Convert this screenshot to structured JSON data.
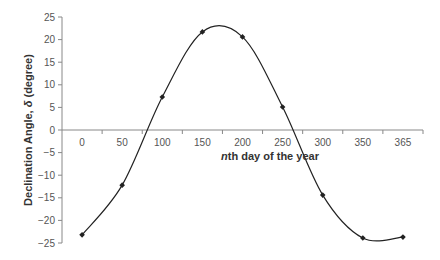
{
  "chart_data": {
    "type": "line",
    "title": "",
    "xlabel_italic_prefix": "n",
    "xlabel_rest": "th day of the year",
    "xlabel": "nth day of the year",
    "ylabel_prefix": "Declination Angle, ",
    "ylabel_symbol": "δ",
    "ylabel_suffix": " (degree)",
    "ylabel": "Declination Angle, δ (degree)",
    "categories": [
      "0",
      "50",
      "100",
      "150",
      "200",
      "250",
      "300",
      "350",
      "365"
    ],
    "x": [
      0,
      50,
      100,
      150,
      200,
      250,
      300,
      350,
      365
    ],
    "series": [
      {
        "name": "Declination Angle",
        "values": [
          -23.2,
          -12.2,
          7.3,
          21.7,
          20.6,
          5.1,
          -14.4,
          -23.9,
          -23.7
        ],
        "smooth": true,
        "marker": "diamond",
        "color": "#222222"
      }
    ],
    "ylim": [
      -25,
      25
    ],
    "yticks": [
      25,
      20,
      15,
      10,
      5,
      0,
      -5,
      -10,
      -15,
      -20,
      -25
    ],
    "ytick_labels": [
      "25",
      "20",
      "15",
      "10",
      "5",
      "0",
      "-5",
      "-10",
      "-15",
      "-20",
      "-25"
    ],
    "grid": false,
    "legend": "none"
  }
}
